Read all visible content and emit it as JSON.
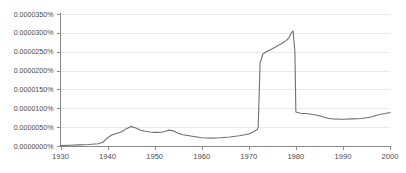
{
  "chart_data": {
    "type": "line",
    "title": "",
    "subtitle": "",
    "xlabel": "",
    "ylabel": "",
    "xlim": [
      1930,
      2000
    ],
    "ylim": [
      0.0,
      3.5e-06
    ],
    "grid": true,
    "legend": "none",
    "y_unit": "%",
    "x_tick_labels": [
      "1930",
      "1940",
      "1950",
      "1960",
      "1970",
      "1980",
      "1990",
      "2000"
    ],
    "x_ticks": [
      1930,
      1940,
      1950,
      1960,
      1970,
      1980,
      1990,
      2000
    ],
    "y_tick_labels": [
      "0.0000000%",
      "0.0000050%",
      "0.0000100%",
      "0.0000150%",
      "0.0000200%",
      "0.0000250%",
      "0.0000300%",
      "0.0000350%"
    ],
    "y_ticks": [
      0.0,
      5e-07,
      1e-06,
      1.5e-06,
      2e-06,
      2.5e-06,
      3e-06,
      3.5e-06
    ],
    "series": [
      {
        "name": "frequency",
        "color": "#6f6f6f",
        "x": [
          1930,
          1932,
          1934,
          1936,
          1938,
          1939,
          1940,
          1941,
          1942,
          1943,
          1944,
          1945,
          1946,
          1947,
          1948,
          1949,
          1950,
          1951,
          1952,
          1953,
          1954,
          1955,
          1956,
          1957,
          1958,
          1959,
          1960,
          1962,
          1964,
          1966,
          1968,
          1970,
          1971,
          1971.8,
          1972,
          1972.4,
          1973,
          1974,
          1975,
          1976,
          1977,
          1978,
          1978.6,
          1979,
          1979.4,
          1979.8,
          1980,
          1981,
          1982,
          1983,
          1984,
          1985,
          1986,
          1987,
          1988,
          1990,
          1992,
          1994,
          1996,
          1997,
          1998,
          1999,
          2000
        ],
        "y": [
          1e-08,
          2e-08,
          3e-08,
          4e-08,
          6e-08,
          1e-07,
          2.2e-07,
          3e-07,
          3.4e-07,
          3.8e-07,
          4.6e-07,
          5.2e-07,
          4.8e-07,
          4.2e-07,
          3.9e-07,
          3.7e-07,
          3.6e-07,
          3.6e-07,
          3.8e-07,
          4.2e-07,
          4e-07,
          3.4e-07,
          3e-07,
          2.8e-07,
          2.6e-07,
          2.4e-07,
          2.2e-07,
          2.1e-07,
          2.2e-07,
          2.4e-07,
          2.7e-07,
          3.2e-07,
          3.8e-07,
          4.4e-07,
          5e-07,
          2.2e-06,
          2.44e-06,
          2.52e-06,
          2.58e-06,
          2.65e-06,
          2.72e-06,
          2.8e-06,
          2.88e-06,
          3e-06,
          3.05e-06,
          2.5e-06,
          9e-07,
          8.7e-07,
          8.6e-07,
          8.5e-07,
          8.3e-07,
          8e-07,
          7.6e-07,
          7.3e-07,
          7.2e-07,
          7.1e-07,
          7.2e-07,
          7.3e-07,
          7.7e-07,
          8.1e-07,
          8.4e-07,
          8.6e-07,
          8.9e-07
        ]
      }
    ]
  },
  "geometry": {
    "plot_left": 60.5,
    "plot_right": 390,
    "plot_top": 14,
    "plot_bottom": 146
  },
  "colors": {
    "line": "#6f6f6f",
    "grid": "#e9e9e9",
    "axis": "#8a8a8a",
    "label": "#4a4a4a",
    "background": "#ffffff"
  }
}
